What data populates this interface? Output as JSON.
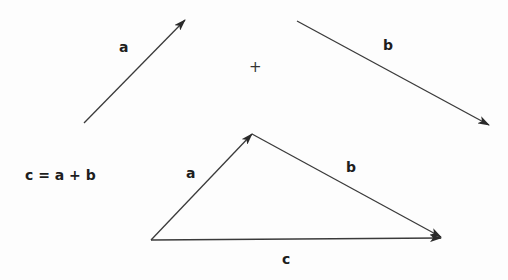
{
  "labels": {
    "top_a": "a",
    "top_b": "b",
    "plus": "+",
    "equation": "c = a + b",
    "tri_a": "a",
    "tri_b": "b",
    "tri_c": "c"
  },
  "colors": {
    "stroke": "#3a3a3a",
    "text": "#1e1e1e",
    "background": "#fdfdfd"
  },
  "vectors": [
    {
      "name": "a",
      "from": [
        84,
        123
      ],
      "to": [
        185,
        20
      ]
    },
    {
      "name": "b",
      "from": [
        297,
        21
      ],
      "to": [
        489,
        125
      ]
    },
    {
      "name": "a",
      "from": [
        151,
        240
      ],
      "to": [
        252,
        134
      ]
    },
    {
      "name": "b",
      "from": [
        252,
        134
      ],
      "to": [
        441,
        237
      ]
    },
    {
      "name": "c",
      "from": [
        151,
        240
      ],
      "to": [
        441,
        238
      ]
    }
  ]
}
